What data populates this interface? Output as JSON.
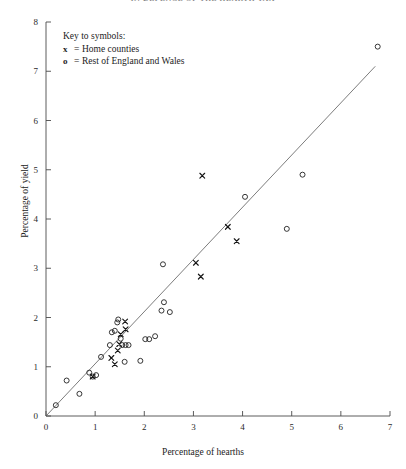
{
  "running_head": "IN DEFENCE OF THE HEARTH TAX",
  "legend": {
    "title": "Key to symbols:",
    "entries": [
      {
        "symbol": "x",
        "equals": "=",
        "label": "Home counties"
      },
      {
        "symbol": "o",
        "equals": "=",
        "label": "Rest of England and Wales"
      }
    ]
  },
  "chart_data": {
    "type": "scatter",
    "title": "",
    "xlabel": "Percentage of hearths",
    "ylabel": "Percentage of yield",
    "xlim": [
      0,
      7
    ],
    "ylim": [
      0,
      8
    ],
    "xticks": [
      "0",
      "1",
      "2",
      "3",
      "4",
      "5",
      "6",
      "7"
    ],
    "yticks": [
      "0",
      "1",
      "2",
      "3",
      "4",
      "5",
      "6",
      "7",
      "8"
    ],
    "grid": false,
    "legend_position": "top-left",
    "reference_line": {
      "name": "diagonal reference line",
      "from": [
        0,
        0
      ],
      "to": [
        6.7,
        7.1
      ],
      "color": "#5a5a5a"
    },
    "series": [
      {
        "name": "Home counties",
        "marker": "x",
        "color": "#151515",
        "points": [
          [
            0.95,
            0.8
          ],
          [
            1.33,
            1.18
          ],
          [
            1.4,
            1.05
          ],
          [
            1.46,
            1.33
          ],
          [
            1.49,
            1.46
          ],
          [
            1.52,
            1.66
          ],
          [
            1.62,
            1.76
          ],
          [
            1.61,
            1.92
          ],
          [
            3.05,
            3.11
          ],
          [
            3.15,
            2.83
          ],
          [
            3.18,
            4.88
          ],
          [
            3.7,
            3.84
          ],
          [
            3.88,
            3.55
          ]
        ]
      },
      {
        "name": "Rest of England and Wales",
        "marker": "o",
        "color": "#202020",
        "points": [
          [
            0.2,
            0.22
          ],
          [
            0.42,
            0.72
          ],
          [
            0.68,
            0.45
          ],
          [
            0.88,
            0.88
          ],
          [
            0.95,
            0.8
          ],
          [
            1.02,
            0.83
          ],
          [
            1.12,
            1.2
          ],
          [
            1.3,
            1.44
          ],
          [
            1.34,
            1.7
          ],
          [
            1.4,
            1.73
          ],
          [
            1.45,
            1.9
          ],
          [
            1.47,
            1.96
          ],
          [
            1.52,
            1.57
          ],
          [
            1.55,
            1.44
          ],
          [
            1.62,
            1.44
          ],
          [
            1.68,
            1.44
          ],
          [
            1.6,
            1.1
          ],
          [
            1.92,
            1.12
          ],
          [
            2.02,
            1.56
          ],
          [
            2.1,
            1.56
          ],
          [
            2.22,
            1.62
          ],
          [
            2.35,
            2.14
          ],
          [
            2.4,
            2.31
          ],
          [
            2.38,
            3.08
          ],
          [
            2.52,
            2.11
          ],
          [
            4.05,
            4.45
          ],
          [
            4.9,
            3.8
          ],
          [
            5.22,
            4.9
          ],
          [
            6.75,
            7.5
          ]
        ]
      }
    ]
  }
}
